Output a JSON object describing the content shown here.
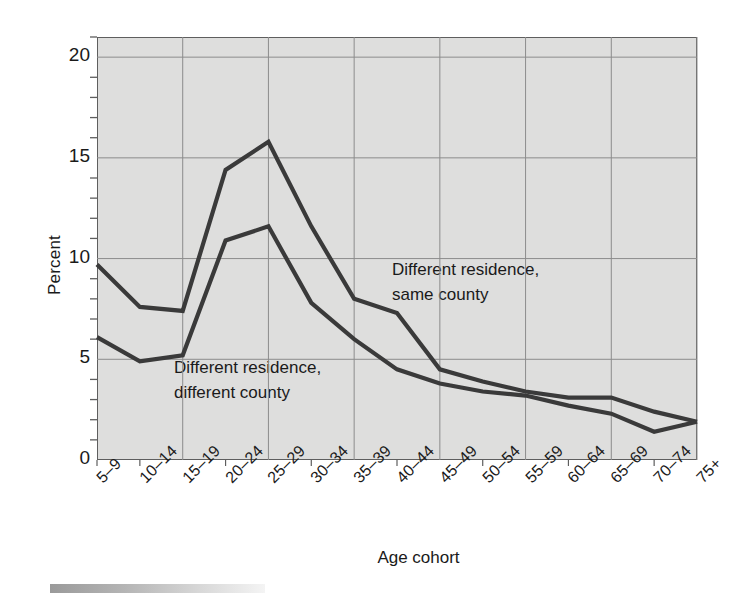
{
  "chart_data": {
    "type": "line",
    "title": "",
    "xlabel": "Age cohort",
    "ylabel": "Percent",
    "ylim": [
      0,
      21
    ],
    "yticks": [
      0,
      5,
      10,
      15,
      20
    ],
    "ytick_labels": [
      "0",
      "5",
      "10",
      "15",
      "20"
    ],
    "y_minor_tick_step": 1,
    "grid": "both",
    "grid_x_categories": [
      "15–19",
      "25–29",
      "35–39",
      "45–49",
      "55–59",
      "65–69",
      "75+"
    ],
    "categories": [
      "5–9",
      "10–14",
      "15–19",
      "20–24",
      "25–29",
      "30–34",
      "35–39",
      "40–44",
      "45–49",
      "50–54",
      "55–59",
      "60–64",
      "65–69",
      "70–74",
      "75+"
    ],
    "legend_position": "inline-annotations",
    "series": [
      {
        "name": "Different residence, same county",
        "annotation_line1": "Different residence,",
        "annotation_line2": "same county",
        "color": "#3a3a3a",
        "values": [
          9.7,
          7.6,
          7.4,
          14.4,
          15.8,
          11.6,
          8.0,
          7.3,
          4.5,
          3.9,
          3.4,
          3.1,
          3.1,
          2.4,
          1.9
        ]
      },
      {
        "name": "Different residence, different county",
        "annotation_line1": "Different residence,",
        "annotation_line2": "different county",
        "color": "#3a3a3a",
        "values": [
          6.1,
          4.9,
          5.2,
          10.9,
          11.6,
          7.8,
          6.0,
          4.5,
          3.8,
          3.4,
          3.2,
          2.7,
          2.3,
          1.4,
          1.9
        ]
      }
    ]
  },
  "figure": {
    "background_color": "#ffffff",
    "plot_background_color": "#dededd",
    "frame_color": "#5e5e5e",
    "grid_color": "#8c8c8c",
    "line_color": "#3a3a3a",
    "text_color": "#1a1a1a"
  }
}
